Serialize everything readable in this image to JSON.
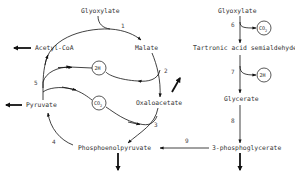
{
  "diagram": {
    "left_cycle": {
      "metabolites": {
        "glyoxylate": "Glyoxylate",
        "acetyl_coa": "Acetyl-CoA",
        "malate": "Malate",
        "oxaloacetate": "Oxaloacetate",
        "pyruvate": "Pyruvate",
        "pep": "Phosphoenolpyruvate"
      },
      "cofactors": {
        "h2": "2H",
        "co2": "CO",
        "co2_sub": "2"
      },
      "steps": [
        "1",
        "2",
        "3",
        "4",
        "5"
      ]
    },
    "right_pathway": {
      "metabolites": {
        "glyoxylate": "Glyoxylate",
        "tartronic": "Tartronic acid semialdehyde",
        "glycerate": "Glycerate",
        "pga": "3-phosphoglycerate"
      },
      "cofactors": {
        "co2": "CO",
        "co2_sub": "2",
        "h2": "2H"
      },
      "steps": [
        "6",
        "7",
        "8"
      ]
    },
    "link_step": "9",
    "colors": {
      "line": "#111111",
      "text": "#333333",
      "background": "#ffffff"
    }
  }
}
